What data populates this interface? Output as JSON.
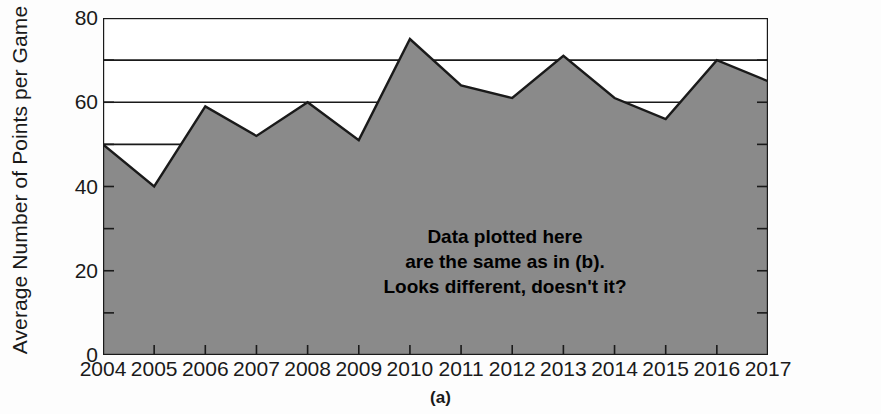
{
  "chart_data": {
    "type": "area",
    "title": "",
    "subtitle": "",
    "xlabel": "",
    "ylabel": "Average Number of Points per Game",
    "categories": [
      "2004",
      "2005",
      "2006",
      "2007",
      "2008",
      "2009",
      "2010",
      "2011",
      "2012",
      "2013",
      "2014",
      "2015",
      "2016",
      "2017"
    ],
    "values": [
      50,
      40,
      59,
      52,
      60,
      51,
      75,
      64,
      61,
      71,
      61,
      56,
      70,
      65
    ],
    "series": [
      {
        "name": "Average Number of Points per Game",
        "values": [
          50,
          40,
          59,
          52,
          60,
          51,
          75,
          64,
          61,
          71,
          61,
          56,
          70,
          65
        ]
      }
    ],
    "ylim": [
      0,
      80
    ],
    "xlim": [
      "2004",
      "2017"
    ],
    "y_major_ticks": [
      0,
      20,
      40,
      60,
      80
    ],
    "y_major_tick_labels": [
      "0",
      "20",
      "40",
      "60",
      "80"
    ],
    "y_minor_ticks": [
      10,
      30,
      50,
      70
    ],
    "y_gridline_values": [
      0,
      10,
      20,
      30,
      40,
      50,
      60,
      70,
      80
    ],
    "grid": true,
    "grid_orientation": "horizontal",
    "legend": false,
    "legend_position": "none",
    "fill_color": "#8a8a8a",
    "line_color": "#1a1a1a",
    "background_color": "#ffffff",
    "annotations": [
      "Data plotted here",
      "are the same as in (b).",
      "Looks different, doesn't it?"
    ]
  },
  "figure": {
    "caption": "(a)",
    "axis_title_y": "Average Number of Points per Game"
  }
}
